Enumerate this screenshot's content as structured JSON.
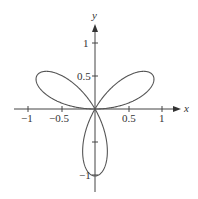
{
  "chart_data": {
    "type": "line",
    "title": "",
    "equation": "r = sin(3θ)",
    "xlabel": "x",
    "ylabel": "y",
    "xlim": [
      -1.1,
      1.2
    ],
    "ylim": [
      -1.15,
      1.25
    ],
    "x_ticks": [
      "-1",
      "-0.5",
      "0.5",
      "1"
    ],
    "y_ticks": [
      "1",
      "0.5",
      "-1"
    ],
    "grid": false,
    "series": [
      {
        "name": "three-petal rose",
        "color": "#555555"
      }
    ]
  },
  "labels": {
    "x_axis": "x",
    "y_axis": "y",
    "tick_x_m1": "−1",
    "tick_x_m05": "−0.5",
    "tick_x_05": "0.5",
    "tick_x_1": "1",
    "tick_y_1": "1",
    "tick_y_05": "0.5",
    "tick_y_m1": "−1"
  }
}
